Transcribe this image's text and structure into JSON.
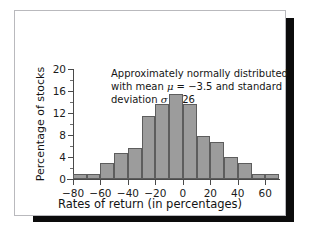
{
  "figure": {
    "background_color": "#ffffff",
    "card_border_color": "#b9b9bd",
    "shadow_color": "#0c0c0c"
  },
  "annotation": {
    "line1": "Approximately normally distributed",
    "line2_pre": "with mean ",
    "line2_mu": "μ",
    "line2_mid": " = −3.5 and standard",
    "line3_pre": "deviation ",
    "line3_sigma": "σ",
    "line3_post": " = 26"
  },
  "chart_data": {
    "type": "bar",
    "title": "",
    "xlabel": "Rates of return (in percentages)",
    "ylabel": "Percentage of stocks",
    "bar_color": "#9c9c9c",
    "bar_edge_color": "#5d5d5d",
    "grid": false,
    "legend": false,
    "xlim": [
      -80,
      70
    ],
    "ylim": [
      0,
      20
    ],
    "bin_width": 10,
    "xticks": [
      -80,
      -60,
      -40,
      -20,
      0,
      20,
      40,
      60
    ],
    "xtick_labels": [
      "−80",
      "−60",
      "−40",
      "−20",
      "0",
      "20",
      "40",
      "60"
    ],
    "yticks": [
      0,
      4,
      8,
      12,
      16,
      20
    ],
    "ytick_labels": [
      "0",
      "4",
      "8",
      "12",
      "16",
      "20"
    ],
    "yticks_minor": [
      2,
      6,
      10,
      14,
      18
    ],
    "bin_starts": [
      -80,
      -70,
      -60,
      -50,
      -40,
      -30,
      -20,
      -10,
      0,
      10,
      20,
      30,
      40,
      50,
      60
    ],
    "bin_ends": [
      -70,
      -60,
      -50,
      -40,
      -30,
      -20,
      -10,
      0,
      10,
      20,
      30,
      40,
      50,
      60,
      70
    ],
    "categories": [
      "−80 to −70",
      "−70 to −60",
      "−60 to −50",
      "−50 to −40",
      "−40 to −30",
      "−30 to −20",
      "−20 to −10",
      "−10 to 0",
      "0 to 10",
      "10 to 20",
      "20 to 30",
      "30 to 40",
      "40 to 50",
      "50 to 60",
      "60 to 70"
    ],
    "values": [
      1.0,
      1.0,
      3.0,
      4.7,
      5.6,
      11.5,
      13.7,
      15.4,
      13.7,
      7.9,
      6.8,
      4.0,
      3.0,
      1.0,
      1.0
    ]
  }
}
